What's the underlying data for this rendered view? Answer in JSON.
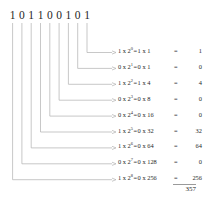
{
  "diagram": {
    "binary_number": "101100101",
    "binary_digits": [
      "1",
      "0",
      "1",
      "1",
      "0",
      "0",
      "1",
      "0",
      "1"
    ],
    "base": "2",
    "line_color": "#b0b0b0",
    "text_color": "#1f1f1f",
    "background_color": "#ffffff",
    "rows": [
      {
        "bit": "1",
        "base": "2",
        "exponent": "0",
        "expr_left": "1 x 2",
        "expr_right": "1 x 1",
        "equals": "=",
        "value": "1"
      },
      {
        "bit": "0",
        "base": "2",
        "exponent": "1",
        "expr_left": "0 x 2",
        "expr_right": "0 x 1",
        "equals": "=",
        "value": "0"
      },
      {
        "bit": "1",
        "base": "2",
        "exponent": "2",
        "expr_left": "1 x 2",
        "expr_right": "1 x 4",
        "equals": "=",
        "value": "4"
      },
      {
        "bit": "0",
        "base": "2",
        "exponent": "3",
        "expr_left": "0 x 2",
        "expr_right": "0 x 8",
        "equals": "=",
        "value": "0"
      },
      {
        "bit": "0",
        "base": "2",
        "exponent": "4",
        "expr_left": "0 x 2",
        "expr_right": "0 x 16",
        "equals": "=",
        "value": "0"
      },
      {
        "bit": "1",
        "base": "2",
        "exponent": "5",
        "expr_left": "1 x 2",
        "expr_right": "0 x 32",
        "equals": "=",
        "value": "32"
      },
      {
        "bit": "1",
        "base": "2",
        "exponent": "6",
        "expr_left": "1 x 2",
        "expr_right": "0 x 64",
        "equals": "=",
        "value": "64"
      },
      {
        "bit": "0",
        "base": "2",
        "exponent": "7",
        "expr_left": "0 x 2",
        "expr_right": "0 x 128",
        "equals": "=",
        "value": "0"
      },
      {
        "bit": "1",
        "base": "2",
        "exponent": "8",
        "expr_left": "1 x 2",
        "expr_right": "0 x 256",
        "equals": "=",
        "value": "256"
      }
    ],
    "total": "357"
  }
}
